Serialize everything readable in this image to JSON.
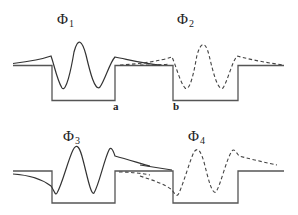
{
  "figure": {
    "panels": [
      {
        "symbol": "Φ",
        "index": "1",
        "wave_style": "solid",
        "well": "left"
      },
      {
        "symbol": "Φ",
        "index": "2",
        "wave_style": "dashed",
        "well": "right"
      },
      {
        "symbol": "Φ",
        "index": "3",
        "wave_style": "solid",
        "well": "left"
      },
      {
        "symbol": "Φ",
        "index": "4",
        "wave_style": "dashed",
        "well": "right"
      }
    ],
    "points": {
      "a": "a",
      "b": "b"
    }
  }
}
